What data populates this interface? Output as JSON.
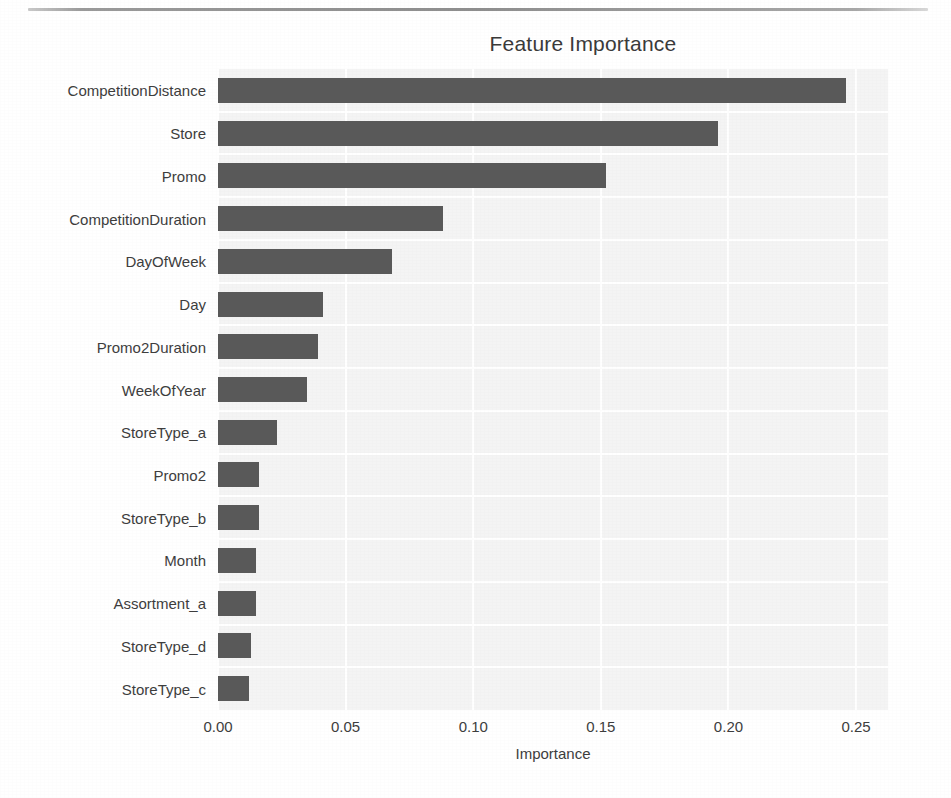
{
  "chart_data": {
    "type": "bar",
    "orientation": "horizontal",
    "title": "Feature Importance",
    "xlabel": "Importance",
    "ylabel": "",
    "xlim": [
      0.0,
      0.2625
    ],
    "xticks": [
      "0.00",
      "0.05",
      "0.10",
      "0.15",
      "0.20",
      "0.25"
    ],
    "xtick_values": [
      0.0,
      0.05,
      0.1,
      0.15,
      0.2,
      0.25
    ],
    "grid": true,
    "legend": "none",
    "bar_color": "#595959",
    "plot_background": "#f4f4f4",
    "gridline_color": "#ffffff",
    "categories": [
      "CompetitionDistance",
      "Store",
      "Promo",
      "CompetitionDuration",
      "DayOfWeek",
      "Day",
      "Promo2Duration",
      "WeekOfYear",
      "StoreType_a",
      "Promo2",
      "StoreType_b",
      "Month",
      "Assortment_a",
      "StoreType_d",
      "StoreType_c"
    ],
    "values": [
      0.246,
      0.196,
      0.152,
      0.088,
      0.068,
      0.041,
      0.039,
      0.035,
      0.023,
      0.016,
      0.016,
      0.015,
      0.015,
      0.013,
      0.012
    ]
  }
}
